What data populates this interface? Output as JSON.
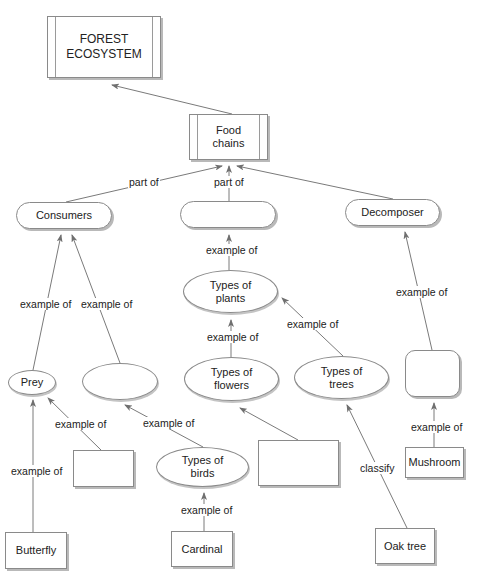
{
  "diagram": {
    "nodes": {
      "forest_ecosystem": {
        "line1": "FOREST",
        "line2": "ECOSYSTEM",
        "shape": "double-rect"
      },
      "food_chains": {
        "line1": "Food",
        "line2": "chains",
        "shape": "double-rect"
      },
      "consumers": {
        "label": "Consumers",
        "shape": "pill"
      },
      "producers_blank": {
        "label": "",
        "shape": "pill"
      },
      "decomposer": {
        "label": "Decomposer",
        "shape": "pill"
      },
      "types_of_plants": {
        "line1": "Types of",
        "line2": "plants",
        "shape": "ellipse"
      },
      "prey": {
        "label": "Prey",
        "shape": "ellipse"
      },
      "predator_blank": {
        "label": "",
        "shape": "ellipse"
      },
      "types_of_flowers": {
        "line1": "Types of",
        "line2": "flowers",
        "shape": "ellipse"
      },
      "types_of_trees": {
        "line1": "Types of",
        "line2": "trees",
        "shape": "ellipse"
      },
      "decomposer_blank": {
        "label": "",
        "shape": "rounded-square"
      },
      "prey_example_blank": {
        "label": "",
        "shape": "rect"
      },
      "types_of_birds": {
        "line1": "Types of",
        "line2": "birds",
        "shape": "ellipse"
      },
      "flower_example_blank": {
        "label": "",
        "shape": "rect"
      },
      "mushroom": {
        "label": "Mushroom",
        "shape": "rect"
      },
      "butterfly": {
        "label": "Butterfly",
        "shape": "rect"
      },
      "cardinal": {
        "label": "Cardinal",
        "shape": "rect"
      },
      "oak_tree": {
        "label": "Oak tree",
        "shape": "rect"
      }
    },
    "edges": [
      {
        "from": "food_chains",
        "to": "forest_ecosystem",
        "label": ""
      },
      {
        "from": "consumers",
        "to": "food_chains",
        "label": "part of"
      },
      {
        "from": "producers_blank",
        "to": "food_chains",
        "label": "part of"
      },
      {
        "from": "decomposer",
        "to": "food_chains",
        "label": ""
      },
      {
        "from": "prey",
        "to": "consumers",
        "label": "example of"
      },
      {
        "from": "predator_blank",
        "to": "consumers",
        "label": "example of"
      },
      {
        "from": "types_of_plants",
        "to": "producers_blank",
        "label": "example of"
      },
      {
        "from": "types_of_flowers",
        "to": "types_of_plants",
        "label": "example of"
      },
      {
        "from": "types_of_trees",
        "to": "types_of_plants",
        "label": "example of"
      },
      {
        "from": "decomposer_blank",
        "to": "decomposer",
        "label": "example of"
      },
      {
        "from": "butterfly",
        "to": "prey",
        "label": "example of"
      },
      {
        "from": "prey_example_blank",
        "to": "prey",
        "label": "example of"
      },
      {
        "from": "types_of_birds",
        "to": "predator_blank",
        "label": "example of"
      },
      {
        "from": "flower_example_blank",
        "to": "types_of_flowers",
        "label": ""
      },
      {
        "from": "oak_tree",
        "to": "types_of_trees",
        "label": "classify"
      },
      {
        "from": "mushroom",
        "to": "decomposer_blank",
        "label": "example of"
      },
      {
        "from": "cardinal",
        "to": "types_of_birds",
        "label": "example of"
      }
    ],
    "labels": {
      "part_of_left": "part of",
      "part_of_mid": "part of",
      "ex_prey_consumers": "example of",
      "ex_blank_consumers": "example of",
      "ex_plants_blank": "example of",
      "ex_flowers_plants": "example of",
      "ex_trees_plants": "example of",
      "ex_blank_decomposer": "example of",
      "ex_butterfly_prey": "example of",
      "ex_rect_prey": "example of",
      "ex_birds_blank": "example of",
      "classify": "classify",
      "ex_mushroom_blank": "example of",
      "ex_cardinal_birds": "example of"
    }
  }
}
